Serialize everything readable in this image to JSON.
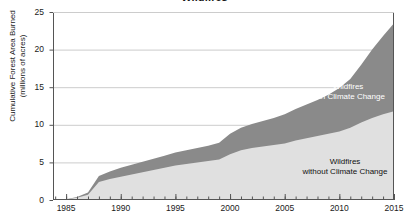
{
  "chart_data": {
    "type": "area",
    "stacked": true,
    "title": "Wildfires",
    "xlabel": "",
    "ylabel": "Cumulative Forest Area Burned (millions of acres)",
    "ylabel_line1": "Cumulative Forest Area Burned",
    "ylabel_line2": "(millions of acres)",
    "xlim": [
      1983.8,
      2015.0
    ],
    "ylim": [
      0,
      25
    ],
    "yticks": [
      0,
      5,
      10,
      15,
      20,
      25
    ],
    "ytick_labels": [
      "0",
      "5",
      "10",
      "15",
      "20",
      "25"
    ],
    "xticks": [
      1985,
      1990,
      1995,
      2000,
      2005,
      2010,
      2015
    ],
    "xtick_labels": [
      "1985",
      "1990",
      "1995",
      "2000",
      "2005",
      "2010",
      "2015"
    ],
    "minor_xticks_interval": 1,
    "grid": "horizontal",
    "legend": "annotations-inline",
    "x": [
      1984,
      1985,
      1986,
      1987,
      1988,
      1989,
      1990,
      1991,
      1992,
      1993,
      1994,
      1995,
      1996,
      1997,
      1998,
      1999,
      2000,
      2001,
      2002,
      2003,
      2004,
      2005,
      2006,
      2007,
      2008,
      2009,
      2010,
      2011,
      2012,
      2013,
      2014,
      2015
    ],
    "series": [
      {
        "name": "Wildfires without Climate Change",
        "color": "#e0e0e0",
        "annotation_line1": "Wildfires",
        "annotation_line2": "without Climate Change",
        "values": [
          0.0,
          0.1,
          0.3,
          0.7,
          2.4,
          2.8,
          3.1,
          3.4,
          3.7,
          4.0,
          4.3,
          4.6,
          4.8,
          5.0,
          5.2,
          5.4,
          6.1,
          6.6,
          6.9,
          7.1,
          7.3,
          7.5,
          7.9,
          8.2,
          8.5,
          8.8,
          9.1,
          9.6,
          10.3,
          10.9,
          11.4,
          11.8
        ]
      },
      {
        "name": "Wildfires with Climate Change",
        "color": "#8a8a8a",
        "annotation_line1": "Wildfires",
        "annotation_line2": "with Climate Change",
        "values": [
          0.0,
          0.1,
          0.4,
          1.0,
          3.2,
          3.8,
          4.3,
          4.7,
          5.1,
          5.5,
          5.9,
          6.3,
          6.6,
          6.9,
          7.2,
          7.6,
          8.8,
          9.6,
          10.1,
          10.5,
          10.9,
          11.4,
          12.1,
          12.7,
          13.3,
          14.0,
          14.9,
          16.1,
          18.0,
          20.0,
          21.8,
          23.5
        ]
      }
    ],
    "colors": {
      "lower_band": "#e0e0e0",
      "upper_band": "#8a8a8a",
      "axis": "#555555",
      "gridline": "#cccccc",
      "text": "#1a1a1a",
      "annotation_on_dark": "#ffffff"
    }
  }
}
